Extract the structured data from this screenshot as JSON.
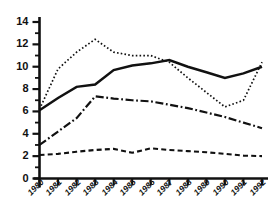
{
  "chart_data": {
    "type": "line",
    "title": "",
    "xlabel": "",
    "ylabel": "",
    "categories": [
      "1980",
      "1981",
      "1982",
      "1983",
      "1984",
      "1985",
      "1986",
      "1987",
      "1988",
      "1989",
      "1990",
      "1991",
      "1992"
    ],
    "x": [
      1980,
      1981,
      1982,
      1983,
      1984,
      1985,
      1986,
      1987,
      1988,
      1989,
      1990,
      1991,
      1992
    ],
    "xlim": [
      1980,
      1992
    ],
    "ylim": [
      0,
      14
    ],
    "ytick_labels": [
      "0",
      "2",
      "4",
      "6",
      "8",
      "10",
      "12",
      "14"
    ],
    "ytick_values": [
      0,
      2,
      4,
      6,
      8,
      10,
      12,
      14
    ],
    "yminor_step": 1,
    "grid": false,
    "legend": "none",
    "series": [
      {
        "name": "solid-series",
        "style": "solid",
        "color": "#111111",
        "values": [
          6.1,
          7.2,
          8.2,
          8.4,
          9.7,
          10.1,
          10.3,
          10.6,
          10.0,
          9.5,
          9.0,
          9.4,
          10.0
        ]
      },
      {
        "name": "dotted-series",
        "style": "dotted",
        "color": "#111111",
        "values": [
          6.2,
          9.8,
          11.3,
          12.45,
          11.3,
          11.0,
          11.0,
          10.4,
          9.0,
          7.7,
          6.4,
          7.0,
          10.4
        ]
      },
      {
        "name": "dash-dot-series",
        "style": "dash-dot",
        "color": "#111111",
        "values": [
          3.0,
          4.2,
          5.4,
          7.35,
          7.15,
          7.0,
          6.9,
          6.6,
          6.3,
          5.9,
          5.5,
          5.0,
          4.5
        ]
      },
      {
        "name": "dashed-series",
        "style": "dashed",
        "color": "#111111",
        "values": [
          2.1,
          2.2,
          2.4,
          2.55,
          2.65,
          2.3,
          2.7,
          2.55,
          2.45,
          2.35,
          2.2,
          2.05,
          2.0
        ]
      }
    ]
  },
  "axes": {
    "axis_color": "#111111",
    "y_axis_name": "y-axis",
    "x_axis_name": "x-axis"
  }
}
